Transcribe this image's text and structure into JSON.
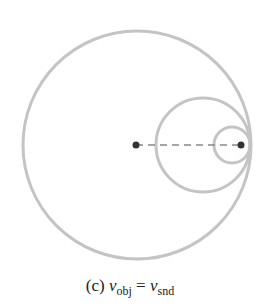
{
  "diagram": {
    "colors": {
      "wavefront": "#c4c4c4",
      "dot": "#333333",
      "dash": "#888888"
    },
    "wavefronts": [
      {
        "cx": 137,
        "cy": 145,
        "r": 114
      },
      {
        "cx": 203,
        "cy": 145,
        "r": 47
      },
      {
        "cx": 232,
        "cy": 145,
        "r": 18
      }
    ],
    "source_start": {
      "x": 136,
      "y": 145
    },
    "source_current": {
      "x": 241,
      "y": 145
    }
  },
  "caption": {
    "label": "(c)",
    "lhs_var": "v",
    "lhs_sub": "obj",
    "eq": "=",
    "rhs_var": "v",
    "rhs_sub": "snd"
  }
}
